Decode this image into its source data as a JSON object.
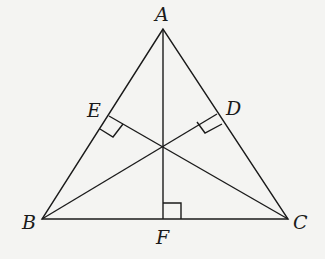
{
  "diagram": {
    "type": "triangle-altitudes",
    "points": {
      "A": {
        "label": "A",
        "x": 163,
        "y": 29
      },
      "B": {
        "label": "B",
        "x": 42,
        "y": 219
      },
      "C": {
        "label": "C",
        "x": 288,
        "y": 219
      },
      "D": {
        "label": "D",
        "x": 217,
        "y": 114
      },
      "E": {
        "label": "E",
        "x": 109,
        "y": 116
      },
      "F": {
        "label": "F",
        "x": 163,
        "y": 219
      },
      "H": {
        "x": 163,
        "y": 146
      }
    },
    "segments": [
      "AB",
      "AC",
      "BC",
      "AF",
      "BD",
      "CE"
    ],
    "right_angles": [
      "E",
      "D",
      "F"
    ],
    "colors": {
      "line": "#1a1a1a",
      "background": "#f4f4f2"
    }
  }
}
